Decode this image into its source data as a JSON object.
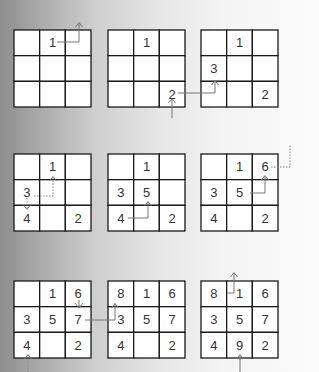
{
  "diagram": {
    "grid_size": 3,
    "panels": [
      {
        "step": 1,
        "cells": [
          [
            "",
            "",
            ""
          ],
          [
            "",
            "1",
            ""
          ],
          [
            "",
            "",
            ""
          ]
        ],
        "layout": [
          [
            "",
            "1",
            ""
          ],
          [
            "",
            "",
            ""
          ],
          [
            "",
            "",
            ""
          ]
        ]
      },
      {
        "step": 2,
        "layout": [
          [
            "",
            "1",
            ""
          ],
          [
            "",
            "",
            ""
          ],
          [
            "",
            "",
            "2"
          ]
        ]
      },
      {
        "step": 3,
        "layout": [
          [
            "",
            "1",
            ""
          ],
          [
            "3",
            "",
            ""
          ],
          [
            "",
            "",
            "2"
          ]
        ]
      },
      {
        "step": 4,
        "layout": [
          [
            "",
            "1",
            ""
          ],
          [
            "3",
            "",
            ""
          ],
          [
            "4",
            "",
            "2"
          ]
        ]
      },
      {
        "step": 5,
        "layout": [
          [
            "",
            "1",
            ""
          ],
          [
            "3",
            "5",
            ""
          ],
          [
            "4",
            "",
            "2"
          ]
        ]
      },
      {
        "step": 6,
        "layout": [
          [
            "",
            "1",
            "6"
          ],
          [
            "3",
            "5",
            ""
          ],
          [
            "4",
            "",
            "2"
          ]
        ]
      },
      {
        "step": 7,
        "layout": [
          [
            "",
            "1",
            "6"
          ],
          [
            "3",
            "5",
            "7"
          ],
          [
            "4",
            "",
            "2"
          ]
        ]
      },
      {
        "step": 8,
        "layout": [
          [
            "8",
            "1",
            "6"
          ],
          [
            "3",
            "5",
            "7"
          ],
          [
            "4",
            "",
            "2"
          ]
        ]
      },
      {
        "step": 9,
        "layout": [
          [
            "8",
            "1",
            "6"
          ],
          [
            "3",
            "5",
            "7"
          ],
          [
            "4",
            "9",
            "2"
          ]
        ]
      }
    ],
    "colors": {
      "grid_line": "#1a1a1a",
      "cell_fill": "#ffffff",
      "arrow": "#777777",
      "text": "#333333",
      "background_left": "#8d8d8d",
      "background_right": "#fbfbfb"
    }
  }
}
